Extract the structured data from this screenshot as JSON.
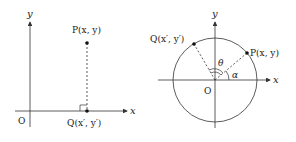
{
  "left_diagram": {
    "y_axis_label": "y",
    "x_axis_label": "x",
    "origin_label": "O",
    "point_p_label": "P(x, y)",
    "point_q_label": "Q(x′, y′)"
  },
  "right_diagram": {
    "y_axis_label": "y",
    "x_axis_label": "x",
    "origin_label": "O",
    "point_p_label": "P(x, y)",
    "point_q_label": "Q(x′, y′)",
    "angle_theta_label": "θ",
    "angle_alpha_label": "α"
  },
  "colors": {
    "line": "#333333",
    "background": "#ffffff"
  }
}
